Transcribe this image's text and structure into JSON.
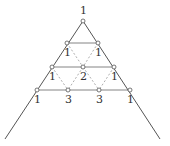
{
  "diagram": {
    "type": "pascal-triangle-lattice",
    "apex_label": "1",
    "rows": [
      {
        "values": [
          "1"
        ]
      },
      {
        "values": [
          "1",
          "1"
        ]
      },
      {
        "values": [
          "1",
          "2",
          "1"
        ]
      },
      {
        "values": [
          "1",
          "3",
          "3",
          "1"
        ]
      }
    ],
    "colors": {
      "line": "#555555",
      "dashed": "#999999",
      "node_fill": "#ffffff"
    }
  }
}
